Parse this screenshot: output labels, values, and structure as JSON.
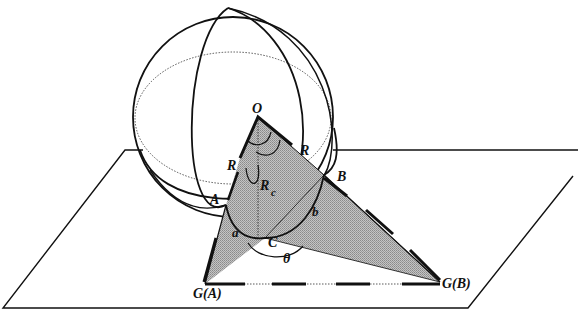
{
  "diagram": {
    "colors": {
      "stroke": "#111111",
      "shade": "#a8a8a8",
      "background": "#ffffff"
    },
    "labels": {
      "O": "O",
      "R_left": "R",
      "R_right": "R",
      "Rc_main": "R",
      "Rc_sub": "c",
      "A": "A",
      "B": "B",
      "C": "C",
      "a": "a",
      "b": "b",
      "theta": "θ",
      "GA": "G(A)",
      "GB": "G(B)"
    }
  }
}
